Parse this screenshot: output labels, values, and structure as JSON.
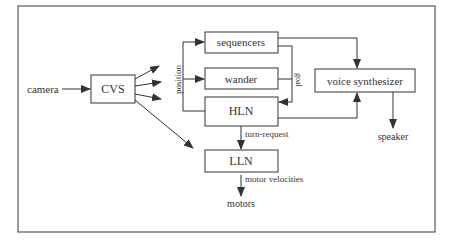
{
  "diagram": {
    "nodes": {
      "camera": "camera",
      "cvs": "CVS",
      "sequencers": "sequencers",
      "wander": "wander",
      "hln": "HLN",
      "lln": "LLN",
      "voice_synthesizer": "voice synthesizer",
      "speaker": "speaker",
      "motors": "motors"
    },
    "edge_labels": {
      "position": "position",
      "goal": "goal",
      "turn_request": "turn-request",
      "motor_velocities": "motor velocities"
    },
    "colors": {
      "line": "#333333",
      "frame": "#555555",
      "background": "#ffffff"
    }
  }
}
